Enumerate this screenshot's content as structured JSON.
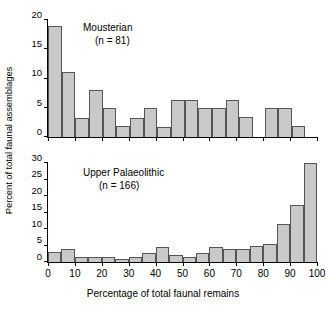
{
  "figure": {
    "ylabel": "Percent of total faunal assemblages",
    "xlabel": "Percentage of total faunal remains",
    "bar_fill": "#c9c9c9",
    "bar_stroke": "#555555",
    "axis_color": "#000000"
  },
  "panels": [
    {
      "key": "mousterian",
      "title": "Mousterian",
      "subtitle": "(n = 81)",
      "ylim": [
        0,
        20
      ],
      "yticks": [
        0,
        5,
        10,
        15,
        20
      ],
      "ytick_labels": [
        "0",
        "5",
        "10",
        "15",
        "20"
      ],
      "xlim": [
        0,
        100
      ],
      "xticks": [
        0,
        10,
        20,
        30,
        40,
        50,
        60,
        70,
        80,
        90,
        100
      ],
      "xtick_labels": [
        "0",
        "10",
        "20",
        "30",
        "40",
        "50",
        "60",
        "70",
        "80",
        "90",
        "100"
      ],
      "show_xticklabels": false
    },
    {
      "key": "upper_palaeolithic",
      "title": "Upper Palaeolithic",
      "subtitle": "(n = 166)",
      "ylim": [
        0,
        30
      ],
      "yticks": [
        0,
        5,
        10,
        15,
        20,
        25,
        30
      ],
      "ytick_labels": [
        "0",
        "5",
        "10",
        "15",
        "20",
        "25",
        "30"
      ],
      "xlim": [
        0,
        100
      ],
      "xticks": [
        0,
        10,
        20,
        30,
        40,
        50,
        60,
        70,
        80,
        90,
        100
      ],
      "xtick_labels": [
        "0",
        "10",
        "20",
        "30",
        "40",
        "50",
        "60",
        "70",
        "80",
        "90",
        "100"
      ],
      "show_xticklabels": true
    }
  ],
  "chart_data": [
    {
      "type": "bar",
      "title": "Mousterian",
      "annotation": "(n = 81)",
      "xlabel": "Percentage of total faunal remains",
      "ylabel": "Percent of total faunal assemblages",
      "xlim": [
        0,
        100
      ],
      "ylim": [
        0,
        20
      ],
      "grid": false,
      "legend": "none",
      "bin_width": 5,
      "bin_edges": [
        0,
        5,
        10,
        15,
        20,
        25,
        30,
        35,
        40,
        45,
        50,
        55,
        60,
        65,
        70,
        75,
        80,
        85,
        90,
        95,
        100
      ],
      "categories": [
        "0-5",
        "5-10",
        "10-15",
        "15-20",
        "20-25",
        "25-30",
        "30-35",
        "35-40",
        "40-45",
        "45-50",
        "50-55",
        "55-60",
        "60-65",
        "65-70",
        "70-75",
        "75-80",
        "80-85",
        "85-90",
        "90-95",
        "95-100"
      ],
      "values": [
        19.0,
        11.1,
        3.3,
        8.0,
        4.9,
        1.8,
        3.3,
        4.9,
        1.7,
        6.3,
        6.3,
        5.0,
        5.0,
        6.3,
        3.4,
        0.0,
        5.0,
        5.0,
        1.9,
        0.0
      ]
    },
    {
      "type": "bar",
      "title": "Upper Palaeolithic",
      "annotation": "(n = 166)",
      "xlabel": "Percentage of total faunal remains",
      "ylabel": "Percent of total faunal assemblages",
      "xlim": [
        0,
        100
      ],
      "ylim": [
        0,
        30
      ],
      "grid": false,
      "legend": "none",
      "bin_width": 5,
      "bin_edges": [
        0,
        5,
        10,
        15,
        20,
        25,
        30,
        35,
        40,
        45,
        50,
        55,
        60,
        65,
        70,
        75,
        80,
        85,
        90,
        95,
        100
      ],
      "categories": [
        "0-5",
        "5-10",
        "10-15",
        "15-20",
        "20-25",
        "25-30",
        "30-35",
        "35-40",
        "40-45",
        "45-50",
        "50-55",
        "55-60",
        "60-65",
        "65-70",
        "70-75",
        "75-80",
        "80-85",
        "85-90",
        "90-95",
        "95-100"
      ],
      "values": [
        3.0,
        3.8,
        1.4,
        1.4,
        1.4,
        0.8,
        1.6,
        2.6,
        4.4,
        2.0,
        1.6,
        2.8,
        4.4,
        4.0,
        4.0,
        5.0,
        5.6,
        11.5,
        17.3,
        30.0
      ]
    }
  ]
}
